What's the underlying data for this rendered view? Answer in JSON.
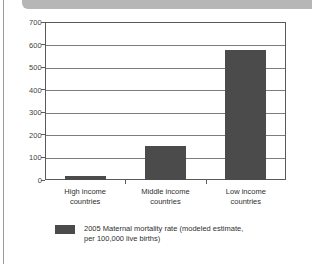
{
  "page": {
    "banner_color": "#b6b6b6",
    "rule_color": "#9a9a9a"
  },
  "chart_data": {
    "type": "bar",
    "title": "",
    "subtitle": "",
    "xlabel": "",
    "ylabel": "",
    "categories": [
      "High income countries",
      "Middle income countries",
      "Low income countries"
    ],
    "category_lines": [
      [
        "High income",
        "countries"
      ],
      [
        "Middle income",
        "countries"
      ],
      [
        "Low income",
        "countries"
      ]
    ],
    "values": [
      20,
      150,
      575
    ],
    "series": [
      {
        "name": "2005 Maternal mortality rate (modeled estimate, per 100,000 live births)",
        "values": [
          20,
          150,
          575
        ],
        "color": "#4b4b4b"
      }
    ],
    "ylim": [
      0,
      700
    ],
    "ytick_labels": [
      "0",
      "100",
      "200",
      "300",
      "400",
      "500",
      "600",
      "700"
    ],
    "ytick_values": [
      0,
      100,
      200,
      300,
      400,
      500,
      600,
      700
    ],
    "grid": true,
    "grid_color": "#7d7d7d",
    "legend_position": "bottom-left",
    "legend": [
      {
        "label_line_1": "2005 Maternal mortality rate (modeled",
        "label_line_2": "estimate, per 100,000 live births)",
        "color": "#4b4b4b"
      }
    ]
  }
}
